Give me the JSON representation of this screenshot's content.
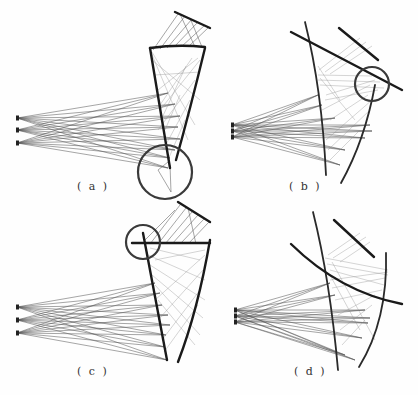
{
  "figure": {
    "width": 418,
    "height": 395,
    "panels": [
      {
        "id": "a",
        "label": "( a )",
        "label_pos": [
          77,
          180
        ],
        "sources": [
          [
            17,
            118
          ],
          [
            17,
            130
          ],
          [
            17,
            143
          ]
        ],
        "ray_targets": [
          [
            168,
            93
          ],
          [
            175,
            104
          ],
          [
            180,
            116
          ],
          [
            178,
            127
          ],
          [
            180,
            139
          ],
          [
            175,
            150
          ],
          [
            170,
            158
          ],
          [
            168,
            168
          ]
        ],
        "mirrors": [
          {
            "type": "path",
            "d": "M150,48 L170,168",
            "class": "mirror"
          },
          {
            "type": "path",
            "d": "M205,48 Q190,110 176,160",
            "class": "mirror"
          },
          {
            "type": "path",
            "d": "M150,48 Q178,44 205,47",
            "class": "mirror"
          },
          {
            "type": "path",
            "d": "M175,12 L210,28",
            "class": "mirror"
          }
        ],
        "fan_lines": [
          [
            "M153,50 L178,14",
            "M160,49 L185,16",
            "M167,48 L192,19",
            "M174,47 L198,22",
            "M181,47 L205,25",
            "M188,47 L209,27",
            "M195,47 L180,14",
            "M202,47 L190,18"
          ]
        ],
        "inner_rays": [
          "M152,60 L200,100",
          "M155,75 L200,72",
          "M158,90 L198,58",
          "M152,52 L195,125",
          "M160,105 L192,58",
          "M162,118 L186,66",
          "M165,130 L180,95",
          "M150,50 L188,140",
          "M200,60 L160,110",
          "M195,80 L158,130",
          "M190,100 L163,150",
          "M185,120 L168,160"
        ],
        "highlight_circle": {
          "cx": 165,
          "cy": 172,
          "r": 27
        },
        "focus_rays": [
          "M168,162 L158,170 L171,192",
          "M170,165 L171,192"
        ]
      },
      {
        "id": "b",
        "label": "( b )",
        "label_pos": [
          289,
          180
        ],
        "sources": [
          [
            232,
            125
          ],
          [
            232,
            131
          ],
          [
            232,
            137
          ]
        ],
        "ray_targets": [
          [
            318,
            95
          ],
          [
            322,
            105
          ],
          [
            335,
            118
          ],
          [
            370,
            125
          ],
          [
            372,
            131
          ],
          [
            365,
            138
          ],
          [
            345,
            150
          ],
          [
            340,
            165
          ]
        ],
        "mirrors": [
          {
            "type": "path",
            "d": "M305,22 Q322,90 326,175",
            "class": "mirror-thin"
          },
          {
            "type": "path",
            "d": "M375,85 Q365,140 341,183",
            "class": "mirror-thin"
          },
          {
            "type": "path",
            "d": "M291,32 L402,90",
            "class": "mirror"
          },
          {
            "type": "path",
            "d": "M339,28 L378,60",
            "class": "mirror"
          }
        ],
        "inner_rays": [
          "M318,75 L372,76",
          "M318,80 L380,82",
          "M320,85 L384,88",
          "M319,70 L360,38",
          "M325,72 L366,42",
          "M330,74 L372,46",
          "M326,95 L375,80",
          "M325,100 L378,90",
          "M322,110 L370,85",
          "M330,120 L368,95",
          "M326,140 L372,100",
          "M328,150 L370,110",
          "M330,160 L360,130",
          "M318,66 L340,100",
          "M320,78 L355,120"
        ],
        "highlight_circle": {
          "cx": 372,
          "cy": 84,
          "r": 17
        }
      },
      {
        "id": "c",
        "label": "( c )",
        "label_pos": [
          77,
          365
        ],
        "sources": [
          [
            17,
            307
          ],
          [
            17,
            320
          ],
          [
            17,
            333
          ]
        ],
        "ray_targets": [
          [
            155,
            283
          ],
          [
            160,
            293
          ],
          [
            162,
            305
          ],
          [
            168,
            315
          ],
          [
            170,
            325
          ],
          [
            166,
            335
          ],
          [
            165,
            347
          ],
          [
            167,
            360
          ]
        ],
        "mirrors": [
          {
            "type": "path",
            "d": "M143,233 L167,360",
            "class": "mirror"
          },
          {
            "type": "path",
            "d": "M210,240 Q198,310 178,362",
            "class": "mirror"
          },
          {
            "type": "path",
            "d": "M132,243 L210,243",
            "class": "mirror"
          },
          {
            "type": "path",
            "d": "M178,202 L210,222",
            "class": "mirror"
          }
        ],
        "fan_lines": [
          [
            "M150,244 L180,205",
            "M158,244 L186,208",
            "M165,244 L192,212",
            "M172,244 L198,215",
            "M180,244 L204,219",
            "M188,244 L209,222",
            "M145,240 L175,210",
            "M196,244 L188,208"
          ]
        ],
        "inner_rays": [
          "M148,255 L205,280",
          "M150,265 L205,300",
          "M152,275 L203,318",
          "M155,285 L200,335",
          "M158,300 L195,345",
          "M205,255 L155,300",
          "M203,270 L158,320",
          "M200,290 L162,340",
          "M198,305 L164,352",
          "M150,248 L200,260",
          "M155,260 L205,250"
        ],
        "highlight_circle": {
          "cx": 143,
          "cy": 242,
          "r": 17
        }
      },
      {
        "id": "d",
        "label": "( d )",
        "label_pos": [
          294,
          365
        ],
        "sources": [
          [
            235,
            310
          ],
          [
            235,
            316
          ],
          [
            235,
            322
          ]
        ],
        "ray_targets": [
          [
            330,
            283
          ],
          [
            335,
            295
          ],
          [
            365,
            310
          ],
          [
            370,
            318
          ],
          [
            368,
            323
          ],
          [
            362,
            338
          ],
          [
            345,
            355
          ],
          [
            355,
            360
          ]
        ],
        "mirrors": [
          {
            "type": "path",
            "d": "M313,212 Q330,280 338,370",
            "class": "mirror-thin"
          },
          {
            "type": "path",
            "d": "M386,253 Q388,320 359,367",
            "class": "mirror-thin"
          },
          {
            "type": "path",
            "d": "M291,244 Q340,292 402,304",
            "class": "mirror"
          },
          {
            "type": "path",
            "d": "M334,220 L374,257",
            "class": "mirror"
          }
        ],
        "inner_rays": [
          "M325,258 L388,270",
          "M327,264 L388,275",
          "M330,270 L384,285",
          "M328,255 L360,233",
          "M333,258 L366,237",
          "M340,262 L370,242",
          "M330,280 L388,272",
          "M332,288 L385,278",
          "M335,300 L382,290",
          "M338,315 L375,295",
          "M340,330 L372,305",
          "M342,345 L365,320",
          "M330,275 L360,330",
          "M332,262 L375,340"
        ]
      }
    ]
  }
}
